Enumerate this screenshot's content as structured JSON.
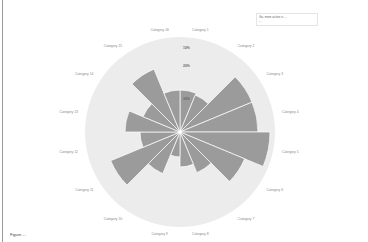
{
  "legend": {
    "line1": "Go, more active is ...",
    "line2": "..."
  },
  "chart_data": {
    "type": "polar-area",
    "title": "",
    "center": [
      180,
      132
    ],
    "outer_radius": 95,
    "radial_ticks": [
      "10%",
      "20%",
      "30%"
    ],
    "categories": [
      "Category 1",
      "Category 2",
      "Category 3",
      "Category 4",
      "Category 5",
      "Category 6",
      "Category 7",
      "Category 8",
      "Category 9",
      "Category 10",
      "Category 11",
      "Category 12",
      "Category 13",
      "Category 14",
      "Category 15",
      "Category 16"
    ],
    "values": [
      42,
      40,
      78,
      78,
      90,
      70,
      44,
      35,
      25,
      45,
      75,
      40,
      55,
      40,
      68,
      42
    ],
    "colors": {
      "wedge": "#9b9b9b",
      "background_circle": "#ececec",
      "spoke": "#ffffff"
    },
    "grid": false,
    "legend_position": "top-right"
  },
  "caption": "Figure ..."
}
